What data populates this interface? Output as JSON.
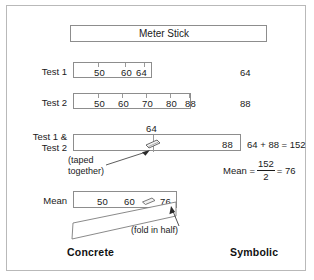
{
  "figure": {
    "meter_stick_label": "Meter Stick",
    "bottom_left_label": "Concrete",
    "bottom_right_label": "Symbolic"
  },
  "rows": [
    {
      "id": "test1",
      "label": "Test 1",
      "ticks": [
        "50",
        "60",
        "64"
      ],
      "right_value": "64"
    },
    {
      "id": "test2",
      "label": "Test 2",
      "ticks": [
        "50",
        "60",
        "70",
        "80",
        "88"
      ],
      "right_value": "88"
    },
    {
      "id": "combined",
      "label_line1": "Test 1 &",
      "label_line2": "Test 2",
      "top_tick": "64",
      "end_tick": "88",
      "note_line1": "(taped",
      "note_line2": "together)"
    },
    {
      "id": "mean",
      "label": "Mean",
      "ticks": [
        "50",
        "60",
        "76"
      ],
      "note": "(fold in half)"
    }
  ],
  "equations": {
    "sum": "64 + 88 = 152",
    "mean_label": "Mean =",
    "mean_numerator": "152",
    "mean_denominator": "2",
    "mean_equals": "= 76"
  },
  "icons": {
    "tape_clip": "tape-clip-icon",
    "arrow": "arrow-icon"
  },
  "colors": {
    "ink": "#1a1a1a",
    "rule": "#8d8d8d",
    "frame": "#b9b9b9",
    "paper": "#ffffff"
  }
}
